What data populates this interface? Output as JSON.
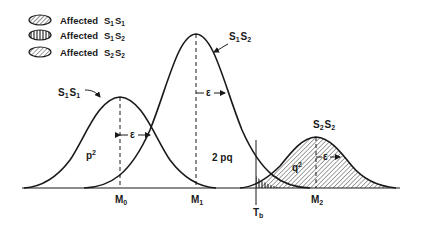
{
  "legend": {
    "items": [
      {
        "label": "Affected",
        "genotype": "S",
        "sub1": "1",
        "genotype2": "S",
        "sub2": "1",
        "pattern": "diagonal-hatch"
      },
      {
        "label": "Affected",
        "genotype": "S",
        "sub1": "1",
        "genotype2": "S",
        "sub2": "2",
        "pattern": "vertical-hatch"
      },
      {
        "label": "Affected",
        "genotype": "S",
        "sub1": "2",
        "genotype2": "S",
        "sub2": "2",
        "pattern": "diagonal-hatch-dense"
      }
    ]
  },
  "curves": [
    {
      "name": "S1S1",
      "label_main": "S",
      "sub1": "1",
      "label_main2": "S",
      "sub2": "1",
      "area_label": "p",
      "area_sup": "2",
      "mean_label": "M",
      "mean_sub": "0"
    },
    {
      "name": "S1S2",
      "label_main": "S",
      "sub1": "1",
      "label_main2": "S",
      "sub2": "2",
      "area_label": "2 pq",
      "mean_label": "M",
      "mean_sub": "1"
    },
    {
      "name": "S2S2",
      "label_main": "S",
      "sub1": "2",
      "label_main2": "S",
      "sub2": "2",
      "area_label": "q",
      "area_sup": "2",
      "mean_label": "M",
      "mean_sub": "2"
    }
  ],
  "epsilon": "ε",
  "threshold": {
    "label": "T",
    "sub": "b"
  },
  "colors": {
    "ink": "#1a1a1a",
    "background": "#ffffff"
  }
}
